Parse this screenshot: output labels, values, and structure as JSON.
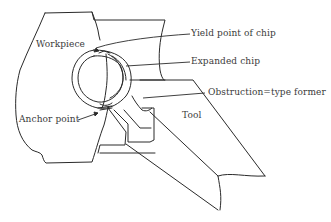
{
  "diagram": {
    "type": "technical-illustration",
    "labels": {
      "workpiece": "Workpiece",
      "yield_point": "Yield point of chip",
      "expanded_chip": "Expanded chip",
      "obstruction_former": "Obstruction=type former",
      "anchor_point": "Anchor point",
      "tool": "Tool"
    },
    "colors": {
      "line": "#2a2a2a",
      "text": "#3a3a3a",
      "background": "#ffffff"
    }
  }
}
